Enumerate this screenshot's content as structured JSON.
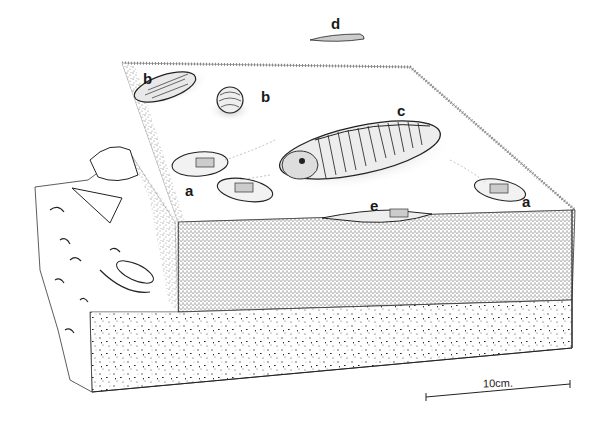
{
  "figure": {
    "colors": {
      "ink": "#1a1a1a",
      "paper": "#ffffff",
      "stipple": "#555555"
    }
  },
  "labels": {
    "a1": "a",
    "a2": "a",
    "b1": "b",
    "b2": "b",
    "c": "c",
    "d": "d",
    "e": "e"
  },
  "specimens": [
    {
      "label": "a",
      "description": "small trilobite with trail, left"
    },
    {
      "label": "a",
      "description": "small trilobite with trail, right"
    },
    {
      "label": "b",
      "description": "elongate trilobite, top left"
    },
    {
      "label": "b",
      "description": "enrolled trilobite"
    },
    {
      "label": "c",
      "description": "large trilobite, center"
    },
    {
      "label": "d",
      "description": "swimming trilobite above block"
    },
    {
      "label": "e",
      "description": "trilobite partially buried in sediment"
    }
  ],
  "scale_bar": {
    "label": "10cm."
  }
}
